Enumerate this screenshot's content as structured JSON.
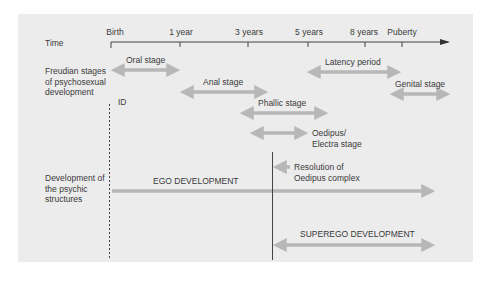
{
  "diagram": {
    "title_rows": {
      "time": "Time",
      "freudian": "Freudian stages of psychosexual development",
      "freudian_lines": [
        "Freudian stages",
        "of psychosexual",
        "development"
      ],
      "psychic": "Development of the psychic structures",
      "psychic_lines": [
        "Development of",
        "the psychic",
        "structures"
      ]
    },
    "timeline": {
      "ticks": [
        {
          "label": "Birth",
          "x": 110
        },
        {
          "label": "1 year",
          "x": 180
        },
        {
          "label": "3 years",
          "x": 248
        },
        {
          "label": "5 years",
          "x": 308
        },
        {
          "label": "8  years",
          "x": 365
        },
        {
          "label": "Puberty",
          "x": 401
        }
      ]
    },
    "stages": [
      {
        "label": "Oral stage",
        "from": "Birth",
        "to": "1 year"
      },
      {
        "label": "Anal stage",
        "from": "1 year",
        "to": "3 years"
      },
      {
        "label": "Phallic stage",
        "from": "3 years",
        "to": "5 years"
      },
      {
        "label": "Oedipus/ Electra stage",
        "label_lines": [
          "Oedipus/",
          "Electra stage"
        ],
        "from": "3 years",
        "to": "5 years (approx.)"
      },
      {
        "label": "Latency period",
        "from": "5 years",
        "to": "Puberty"
      },
      {
        "label": "Genital stage",
        "from": "Puberty",
        "to": "onward"
      }
    ],
    "structures": [
      {
        "label": "ID"
      },
      {
        "label": "EGO DEVELOPMENT"
      },
      {
        "label": "SUPEREGO DEVELOPMENT"
      }
    ],
    "annotation": {
      "label": "Resolution of Oedipus complex",
      "label_lines": [
        "Resolution of",
        "Oedipus complex"
      ]
    },
    "colors": {
      "panel": "#ececec",
      "arrow": "#b7b7b7",
      "axis": "#444444",
      "text": "#3a3a3a"
    }
  }
}
